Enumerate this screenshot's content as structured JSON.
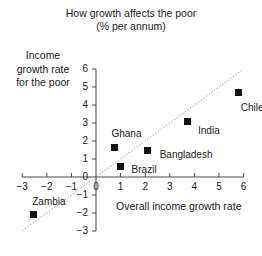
{
  "chart_data": {
    "type": "scatter",
    "title": "How growth affects the poor",
    "subtitle": "(% per annum)",
    "xlabel": "Overall income growth rate",
    "ylabel": "Income growth rate for the poor",
    "ylabel_lines": [
      "Income",
      "growth rate",
      "for the poor"
    ],
    "xlim": [
      -3,
      6
    ],
    "ylim": [
      -3,
      6
    ],
    "xticks": [
      "−3",
      "−2",
      "−1",
      "0",
      "1",
      "2",
      "3",
      "4",
      "5",
      "6"
    ],
    "xtick_values": [
      -3,
      -2,
      -1,
      0,
      1,
      2,
      3,
      4,
      5,
      6
    ],
    "yticks": [
      "6",
      "5",
      "4",
      "3",
      "2",
      "1",
      "0",
      "−1",
      "−2",
      "−3"
    ],
    "ytick_values": [
      6,
      5,
      4,
      3,
      2,
      1,
      0,
      -1,
      -2,
      -3
    ],
    "grid": false,
    "legend": "none",
    "reference_line": {
      "type": "45-degree-dotted",
      "slope": 1,
      "intercept": 0,
      "style": "dotted"
    },
    "points": [
      {
        "name": "Chile",
        "x": 5.8,
        "y": 4.7,
        "label_dx": 2,
        "label_dy": 16
      },
      {
        "name": "India",
        "x": 3.7,
        "y": 3.1,
        "label_dx": 11,
        "label_dy": 10
      },
      {
        "name": "Bangladesh",
        "x": 2.1,
        "y": 1.45,
        "label_dx": 12,
        "label_dy": 4
      },
      {
        "name": "Ghana",
        "x": 0.75,
        "y": 1.65,
        "label_dx": -3,
        "label_dy": -13
      },
      {
        "name": "Brazil",
        "x": 1.0,
        "y": 0.6,
        "label_dx": 11,
        "label_dy": 4
      },
      {
        "name": "Zambia",
        "x": -2.55,
        "y": -2.1,
        "label_dx": -1,
        "label_dy": -13
      }
    ]
  }
}
